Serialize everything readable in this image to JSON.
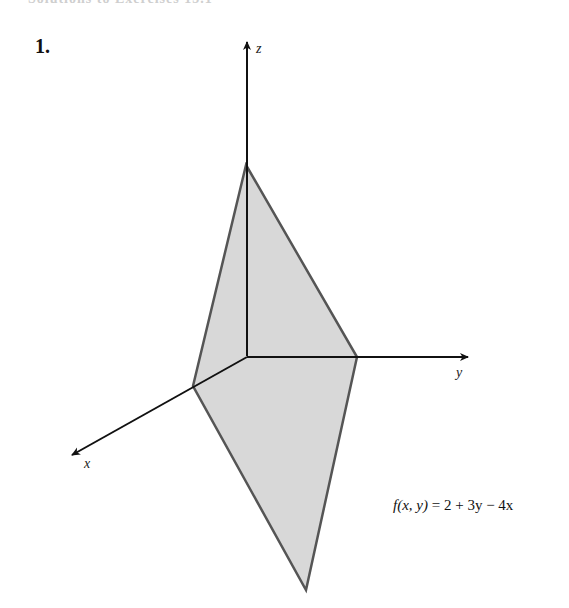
{
  "header": {
    "cutoff_text": "Solutions to Exercises 15.1"
  },
  "problem": {
    "number": "1."
  },
  "figure": {
    "type": "3d-plane-plot",
    "axes": {
      "x_label": "x",
      "y_label": "y",
      "z_label": "z"
    },
    "plane": {
      "fill_color": "#d8d8d8",
      "edge_color": "#555555",
      "vertices_px": [
        [
          246,
          165
        ],
        [
          357,
          357
        ],
        [
          306,
          590
        ],
        [
          193,
          386
        ]
      ]
    },
    "formula": {
      "lhs_func": "f",
      "lhs_args": "(x, y)",
      "equals": " = ",
      "rhs": "2 + 3y − 4x"
    }
  }
}
